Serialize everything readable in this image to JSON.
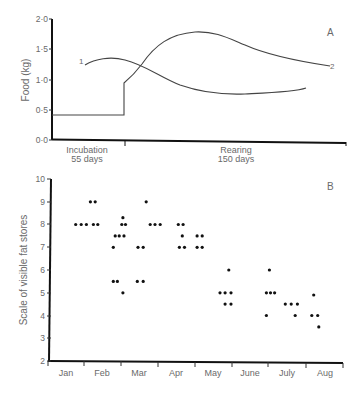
{
  "chart_data": [
    {
      "panel": "A",
      "type": "line",
      "title": "",
      "xlabel": "",
      "ylabel": "Food (kg)",
      "ylim": [
        0.0,
        2.0
      ],
      "yticks": [
        "0·0",
        "0·5",
        "1·0",
        "1·5",
        "2·0"
      ],
      "x_segments": [
        {
          "label": "Incubation",
          "sublabel": "55 days"
        },
        {
          "label": "Rearing",
          "sublabel": "150 days"
        }
      ],
      "series": [
        {
          "name": "1",
          "description": "Curve 1",
          "points": [
            [
              0.13,
              1.25
            ],
            [
              0.22,
              1.31
            ],
            [
              0.3,
              1.3
            ],
            [
              0.4,
              1.18
            ],
            [
              0.5,
              1.0
            ],
            [
              0.6,
              0.86
            ],
            [
              0.7,
              0.78
            ],
            [
              0.78,
              0.77
            ],
            [
              0.87,
              0.83
            ]
          ]
        },
        {
          "name": "2",
          "description": "Curve 2 (step at end of incubation)",
          "points": [
            [
              0.0,
              0.42
            ],
            [
              0.25,
              0.42
            ],
            [
              0.25,
              0.95
            ],
            [
              0.3,
              1.1
            ],
            [
              0.38,
              1.5
            ],
            [
              0.46,
              1.75
            ],
            [
              0.52,
              1.8
            ],
            [
              0.6,
              1.7
            ],
            [
              0.7,
              1.5
            ],
            [
              0.82,
              1.35
            ],
            [
              0.95,
              1.22
            ]
          ]
        }
      ]
    },
    {
      "panel": "B",
      "type": "scatter",
      "title": "",
      "xlabel": "",
      "ylabel": "Scale of visible fat stores",
      "ylim": [
        2,
        10
      ],
      "yticks": [
        "2",
        "3",
        "4",
        "5",
        "6",
        "7",
        "8",
        "9",
        "10"
      ],
      "categories": [
        "Jan",
        "Feb",
        "Mar",
        "Apr",
        "May",
        "June",
        "July",
        "Aug"
      ],
      "points": [
        {
          "month_pos": 0.75,
          "y": 8
        },
        {
          "month_pos": 0.9,
          "y": 8
        },
        {
          "month_pos": 1.04,
          "y": 8
        },
        {
          "month_pos": 1.15,
          "y": 9
        },
        {
          "month_pos": 1.28,
          "y": 9
        },
        {
          "month_pos": 1.23,
          "y": 8
        },
        {
          "month_pos": 1.35,
          "y": 8
        },
        {
          "month_pos": 1.77,
          "y": 7
        },
        {
          "month_pos": 1.82,
          "y": 7.5
        },
        {
          "month_pos": 1.93,
          "y": 7.5
        },
        {
          "month_pos": 2.06,
          "y": 7.5
        },
        {
          "month_pos": 2.0,
          "y": 8
        },
        {
          "month_pos": 2.1,
          "y": 8
        },
        {
          "month_pos": 2.03,
          "y": 8.3
        },
        {
          "month_pos": 1.77,
          "y": 5.5
        },
        {
          "month_pos": 1.88,
          "y": 5.5
        },
        {
          "month_pos": 2.03,
          "y": 5
        },
        {
          "month_pos": 2.44,
          "y": 7
        },
        {
          "month_pos": 2.58,
          "y": 7
        },
        {
          "month_pos": 2.42,
          "y": 5.5
        },
        {
          "month_pos": 2.58,
          "y": 5.5
        },
        {
          "month_pos": 2.66,
          "y": 9
        },
        {
          "month_pos": 2.77,
          "y": 8
        },
        {
          "month_pos": 2.9,
          "y": 8
        },
        {
          "month_pos": 3.04,
          "y": 8
        },
        {
          "month_pos": 3.53,
          "y": 8
        },
        {
          "month_pos": 3.66,
          "y": 8
        },
        {
          "month_pos": 3.64,
          "y": 7.5
        },
        {
          "month_pos": 3.56,
          "y": 7
        },
        {
          "month_pos": 3.7,
          "y": 7
        },
        {
          "month_pos": 4.04,
          "y": 7.5
        },
        {
          "month_pos": 4.18,
          "y": 7.5
        },
        {
          "month_pos": 4.04,
          "y": 7
        },
        {
          "month_pos": 4.18,
          "y": 7
        },
        {
          "month_pos": 4.9,
          "y": 6
        },
        {
          "month_pos": 4.66,
          "y": 5
        },
        {
          "month_pos": 4.8,
          "y": 5
        },
        {
          "month_pos": 4.96,
          "y": 5
        },
        {
          "month_pos": 4.8,
          "y": 4.5
        },
        {
          "month_pos": 4.96,
          "y": 4.5
        },
        {
          "month_pos": 6.0,
          "y": 6
        },
        {
          "month_pos": 5.92,
          "y": 5
        },
        {
          "month_pos": 6.03,
          "y": 5
        },
        {
          "month_pos": 6.14,
          "y": 5
        },
        {
          "month_pos": 5.92,
          "y": 4
        },
        {
          "month_pos": 6.43,
          "y": 4.5
        },
        {
          "month_pos": 6.59,
          "y": 4.5
        },
        {
          "month_pos": 6.76,
          "y": 4.5
        },
        {
          "month_pos": 6.7,
          "y": 4
        },
        {
          "month_pos": 7.2,
          "y": 4.9
        },
        {
          "month_pos": 7.15,
          "y": 4
        },
        {
          "month_pos": 7.31,
          "y": 4
        },
        {
          "month_pos": 7.34,
          "y": 3.5
        }
      ]
    }
  ],
  "figure": {
    "panel_a_label": "A",
    "panel_b_label": "B",
    "panel_a": {
      "ylabel": "Food (kg)",
      "yticks": [
        "2·0",
        "1·5",
        "1·0",
        "0·5",
        "0·0"
      ],
      "curve1_label": "1",
      "curve2_label": "2",
      "incubation_label": "Incubation",
      "incubation_days": "55 days",
      "rearing_label": "Rearing",
      "rearing_days": "150 days"
    },
    "panel_b": {
      "ylabel": "Scale of visible fat stores",
      "yticks": [
        "10",
        "9",
        "8",
        "7",
        "6",
        "5",
        "4",
        "3",
        "2"
      ],
      "months": [
        "Jan",
        "Feb",
        "Mar",
        "Apr",
        "May",
        "June",
        "July",
        "Aug"
      ]
    }
  }
}
